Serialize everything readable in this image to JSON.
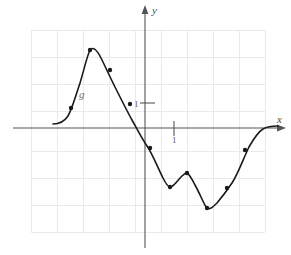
{
  "figure": {
    "title": "",
    "curve_name": "g",
    "axis_x_label": "x",
    "axis_y_label": "y",
    "unit_label_y": "1",
    "unit_label_x": "1",
    "colors": {
      "grid": "#e8e8ec",
      "axis": "#555555",
      "curve": "#1a1a1a",
      "point": "#1a1a1a",
      "label": "#5a5a5a"
    }
  },
  "chart_data": {
    "type": "line",
    "title": "",
    "xlabel": "x",
    "ylabel": "y",
    "curve_label": "g",
    "grid": true,
    "legend": "none",
    "axis_origin_px": {
      "x": 145,
      "y": 128
    },
    "grid_spacing_px": 27,
    "xlim": [
      -4.22,
      4.44
    ],
    "ylim": [
      -3.85,
      3.63
    ],
    "x_unit_tick": 1,
    "y_unit_tick": 1,
    "x": [
      -4.22,
      -3.6,
      -2.74,
      -2.04,
      -1.3,
      -0.56,
      0.0,
      0.19,
      0.93,
      1.48,
      2.04,
      2.3,
      2.78,
      3.33,
      3.7,
      4.07,
      4.44
    ],
    "y": [
      -0.07,
      -0.07,
      0.74,
      2.89,
      2.15,
      0.93,
      0.3,
      0.0,
      -0.74,
      -2.19,
      -1.67,
      -1.7,
      -2.96,
      -2.22,
      -0.81,
      -0.15,
      0.07
    ],
    "marked_points_px": [
      {
        "x": 71,
        "y": 108
      },
      {
        "x": 90,
        "y": 50
      },
      {
        "x": 110,
        "y": 70
      },
      {
        "x": 130,
        "y": 104
      },
      {
        "x": 150,
        "y": 148
      },
      {
        "x": 170,
        "y": 187
      },
      {
        "x": 187,
        "y": 173
      },
      {
        "x": 207,
        "y": 208
      },
      {
        "x": 227,
        "y": 188
      },
      {
        "x": 245,
        "y": 150
      }
    ],
    "marked_points_data": [
      {
        "x": -2.74,
        "y": 0.74
      },
      {
        "x": -2.04,
        "y": 2.89
      },
      {
        "x": -1.3,
        "y": 2.15
      },
      {
        "x": -0.56,
        "y": 0.89
      },
      {
        "x": 0.19,
        "y": -0.74
      },
      {
        "x": 0.93,
        "y": -2.19
      },
      {
        "x": 1.56,
        "y": -1.67
      },
      {
        "x": 2.3,
        "y": -2.96
      },
      {
        "x": 3.04,
        "y": -2.22
      },
      {
        "x": 3.7,
        "y": -0.81
      }
    ],
    "curve_path": "M 53,124 C 60,124 64,122 68,116 C 72,109 75,98 80,83 C 84,70 87,56 90,50 C 93,46 97,50 101,58 C 105,66 110,77 114,85 C 120,97 127,111 132,120 C 136,127 142,139 147,146 C 152,153 158,168 163,178 C 166,184 169,188 171,187 C 174,186 178,180 182,176 C 184,174 186,173 187,173 C 189,174 192,179 195,185 C 199,192 203,202 206,207 C 209,211 213,207 217,203 C 222,197 228,189 232,183 C 238,174 244,157 249,147 C 253,140 258,132 263,129 C 268,126 273,126 278,126"
  }
}
